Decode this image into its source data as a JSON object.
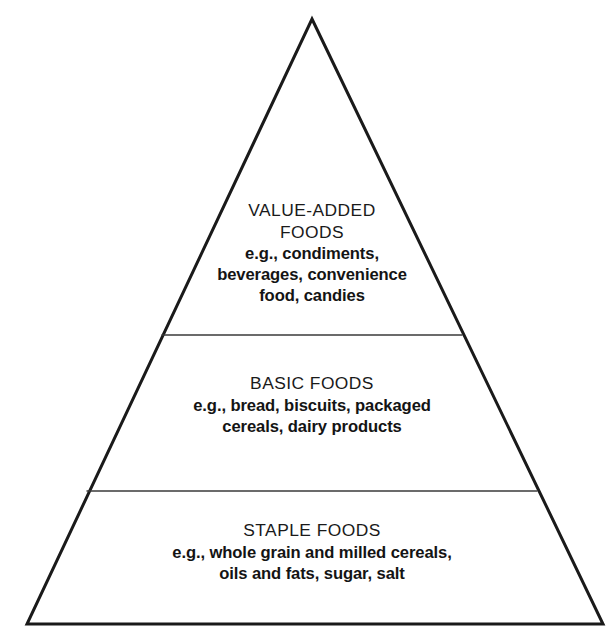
{
  "diagram": {
    "name": "food-pyramid",
    "type": "pyramid",
    "shape_label": "triangle",
    "background_color": "#ffffff",
    "stroke_color": "#1a1a1a",
    "divider_color": "#3a3a3a",
    "text_color": "#141414",
    "tier_count": 3,
    "geometry": {
      "apex_x": 312,
      "apex_y": 19,
      "base_left_x": 27,
      "base_right_x": 603,
      "base_y": 624,
      "divider_1_y": 335,
      "divider_2_y": 491,
      "outline_stroke_width": 3,
      "divider_stroke_width": 1.6
    },
    "tiers": [
      {
        "id": "value-added",
        "position": "top",
        "heading_lines": [
          "VALUE-ADDED",
          "FOODS"
        ],
        "body_lines": [
          "e.g., condiments,",
          "beverages, convenience",
          "food, candies"
        ]
      },
      {
        "id": "basic",
        "position": "middle",
        "heading_lines": [
          "BASIC FOODS"
        ],
        "body_lines": [
          "e.g., bread, biscuits, packaged",
          "cereals, dairy products"
        ]
      },
      {
        "id": "staple",
        "position": "bottom",
        "heading_lines": [
          "STAPLE FOODS"
        ],
        "body_lines": [
          "e.g., whole grain and milled cereals,",
          "oils and fats, sugar, salt"
        ]
      }
    ]
  }
}
